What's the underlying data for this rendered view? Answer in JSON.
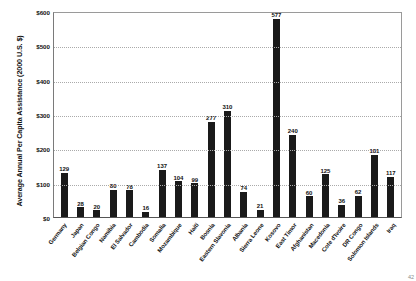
{
  "chart_data": {
    "type": "bar",
    "title": "",
    "xlabel": "",
    "ylabel": "Average Annual Per Capita Assistance (2000 U.S. $)",
    "ylim": [
      0,
      600
    ],
    "yticks": [
      "$0",
      "$100",
      "$200",
      "$300",
      "$400",
      "$500",
      "$600"
    ],
    "ytick_values": [
      0,
      100,
      200,
      300,
      400,
      500,
      600
    ],
    "grid": true,
    "legend": "none",
    "categories": [
      "Germany",
      "Japan",
      "Belgian Congo",
      "Namibia",
      "El Salvador",
      "Cambodia",
      "Somalia",
      "Mozambique",
      "Haiti",
      "Bosnia",
      "Eastern Slavonia",
      "Albania",
      "Sierra Leone",
      "Kosovo",
      "East Timor",
      "Afghanistan",
      "Macedonia",
      "Cote d'Ivoire",
      "DR Congo",
      "Solomon Islands",
      "Iraq"
    ],
    "values": [
      129,
      28,
      20,
      80,
      78,
      16,
      137,
      104,
      99,
      277,
      310,
      74,
      21,
      577,
      240,
      60,
      125,
      36,
      62,
      181,
      117
    ]
  },
  "axis": {
    "y_title": "Average Annual Per Capita Assistance (2000 U.S. $)"
  },
  "footer": {
    "corner_mark": "42"
  }
}
